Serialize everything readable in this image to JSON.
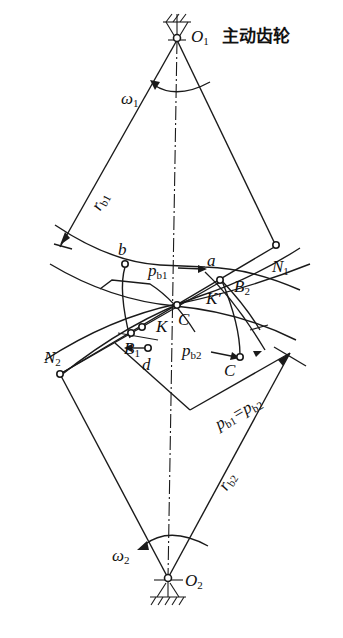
{
  "title": "主动齿轮",
  "labels": {
    "O1": "O",
    "O1_sub": "1",
    "O2": "O",
    "O2_sub": "2",
    "omega1": "ω",
    "omega1_sub": "1",
    "omega2": "ω",
    "omega2_sub": "2",
    "rb1": "r",
    "rb1_sub": "b1",
    "rb2": "r",
    "rb2_sub": "b2",
    "a": "a",
    "b": "b",
    "d": "d",
    "C": "C",
    "C_prime": "C",
    "K": "K",
    "K_prime": "K′",
    "N1": "N",
    "N1_sub": "1",
    "N2": "N",
    "N2_sub": "2",
    "B1": "B",
    "B1_sub": "1",
    "B2": "B",
    "B2_sub": "2",
    "pb1": "p",
    "pb1_sub": "b1",
    "pb2": "p",
    "pb2_sub": "b2",
    "pb_eq_a": "p",
    "pb_eq_a_sub": "b1",
    "pb_eq_mid": "=",
    "pb_eq_b": "p",
    "pb_eq_b_sub": "b2"
  },
  "colors": {
    "line": "#1a1a1a",
    "background": "#ffffff"
  }
}
